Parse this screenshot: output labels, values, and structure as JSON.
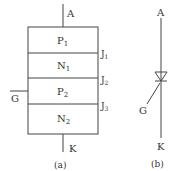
{
  "figure_a": {
    "caption": "(a)",
    "terminal_anode": "A",
    "terminal_cathode": "K",
    "terminal_gate": "G",
    "layers": [
      {
        "base": "P",
        "sub": "1"
      },
      {
        "base": "N",
        "sub": "1"
      },
      {
        "base": "P",
        "sub": "2"
      },
      {
        "base": "N",
        "sub": "2"
      }
    ],
    "junctions": [
      {
        "base": "J",
        "sub": "1"
      },
      {
        "base": "J",
        "sub": "2"
      },
      {
        "base": "J",
        "sub": "3"
      }
    ]
  },
  "figure_b": {
    "caption": "(b)",
    "terminal_anode": "A",
    "terminal_cathode": "K",
    "terminal_gate": "G",
    "symbol": "thyristor-symbol"
  },
  "colors": {
    "line": "#444444",
    "text": "#333333"
  }
}
